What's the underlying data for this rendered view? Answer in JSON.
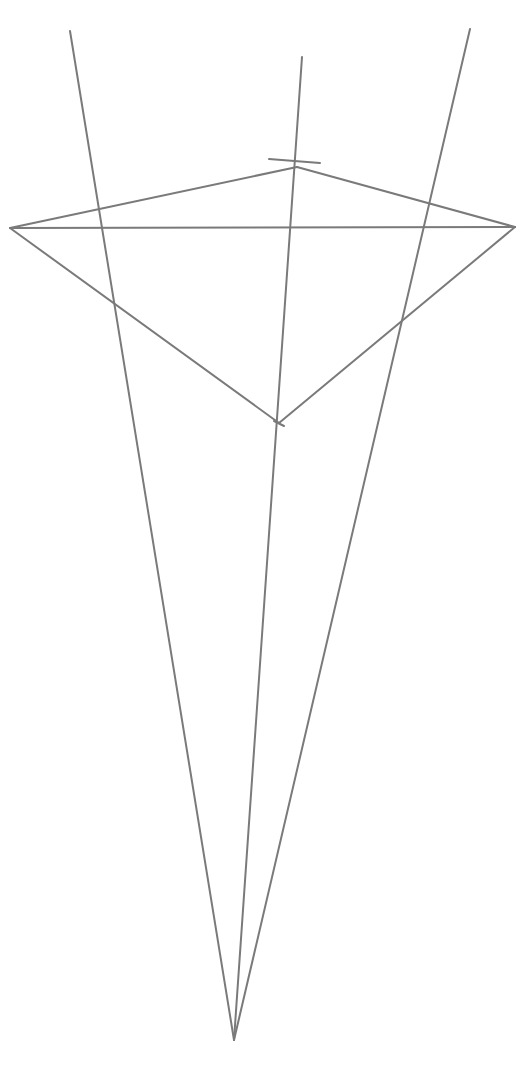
{
  "diagram": {
    "type": "perspective-construction",
    "background": "#ffffff",
    "stroke_color": "#7a7a7a",
    "stroke_width": 2,
    "apex": {
      "x": 234,
      "y": 1040
    },
    "rays": [
      {
        "id": "ray-left",
        "x1": 234,
        "y1": 1040,
        "x2": 70,
        "y2": 31
      },
      {
        "id": "ray-middle",
        "x1": 234,
        "y1": 1040,
        "x2": 302,
        "y2": 57
      },
      {
        "id": "ray-right",
        "x1": 234,
        "y1": 1040,
        "x2": 470,
        "y2": 29
      }
    ],
    "quad": {
      "left": {
        "x": 10,
        "y": 228
      },
      "top": {
        "x": 297,
        "y": 167
      },
      "right": {
        "x": 515,
        "y": 227
      },
      "bottom": {
        "x": 279,
        "y": 423
      }
    },
    "horizontal": {
      "x1": 10,
      "y1": 228,
      "x2": 515,
      "y2": 227
    },
    "top_tick": {
      "x1": 269,
      "y1": 159,
      "x2": 320,
      "y2": 163
    },
    "bottom_tick": {
      "x1": 274,
      "y1": 421,
      "x2": 284,
      "y2": 426
    }
  }
}
